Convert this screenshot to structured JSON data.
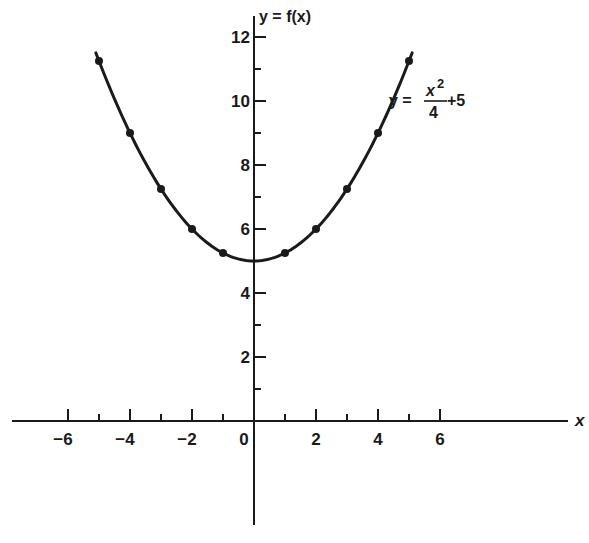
{
  "chart_data": {
    "type": "line",
    "title": "",
    "function_label": {
      "prefix": "y =",
      "numerator": "x",
      "exponent": "2",
      "denominator": "4",
      "suffix": "+5"
    },
    "xlabel": "x",
    "ylabel": "y = f(x)",
    "xlim": [
      -7.9,
      10.1
    ],
    "ylim": [
      -3.3,
      12.6
    ],
    "x_ticks_major": [
      -6,
      -4,
      -2,
      0,
      2,
      4,
      6
    ],
    "x_tick_labels": [
      "−6",
      "−4",
      "−2",
      "0",
      "2",
      "4",
      "6"
    ],
    "x_ticks_minor": [
      -5,
      -3,
      -1,
      1,
      3,
      5
    ],
    "y_ticks_major": [
      2,
      4,
      6,
      8,
      10,
      12
    ],
    "y_tick_labels": [
      "2",
      "4",
      "6",
      "8",
      "10",
      "12"
    ],
    "y_ticks_minor": [
      1,
      3,
      5,
      7,
      9,
      11
    ],
    "grid": false,
    "legend": null,
    "series": [
      {
        "name": "y = x^2/4 + 5",
        "curve_x_range": [
          -5.1,
          5.1
        ],
        "points": [
          {
            "x": -5,
            "y": 11.25
          },
          {
            "x": -4,
            "y": 9
          },
          {
            "x": -3,
            "y": 7.25
          },
          {
            "x": -2,
            "y": 6
          },
          {
            "x": -1,
            "y": 5.25
          },
          {
            "x": 1,
            "y": 5.25
          },
          {
            "x": 2,
            "y": 6
          },
          {
            "x": 3,
            "y": 7.25
          },
          {
            "x": 4,
            "y": 9
          },
          {
            "x": 5,
            "y": 11.25
          }
        ]
      }
    ],
    "colors": {
      "ink": "#1a1a1a",
      "background": "#ffffff"
    }
  }
}
